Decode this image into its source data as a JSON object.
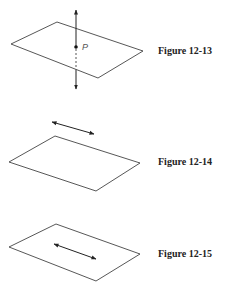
{
  "figures": [
    {
      "caption": "Figure 12-13",
      "point_label": "P",
      "description": "Line perpendicular to plane through point P"
    },
    {
      "caption": "Figure 12-14",
      "description": "Line parallel to plane, lying above it"
    },
    {
      "caption": "Figure 12-15",
      "description": "Line lying in the plane"
    }
  ],
  "colors": {
    "stroke": "#333333",
    "background": "#ffffff"
  }
}
